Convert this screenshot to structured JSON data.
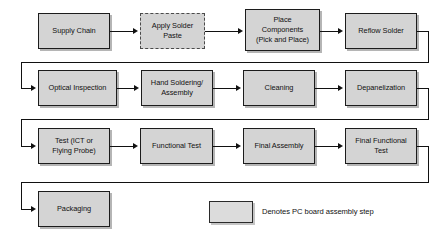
{
  "diagram": {
    "legend": {
      "swatch_name": "assembly-step-swatch",
      "text": "Denotes PC board assembly step",
      "fill_color": "#d4d4d4",
      "border_color": "#1c1c1c"
    },
    "colors": {
      "node_fill": "#d4d4d4",
      "node_border": "#1c1c1c",
      "dashed_border": "#4a4a4a",
      "edge": "#111111",
      "background": "#ffffff",
      "text": "#111111"
    },
    "rows": [
      {
        "index": 1,
        "nodes": [
          {
            "id": "supply-chain",
            "label": "Supply Chain",
            "lines": [
              "Supply Chain"
            ],
            "style": "solid"
          },
          {
            "id": "apply-solder-paste",
            "label": "Apply Solder Paste",
            "lines": [
              "Apply Solder",
              "Paste"
            ],
            "style": "dashed"
          },
          {
            "id": "place-components",
            "label": "Place Components (Pick and Place)",
            "lines": [
              "Place",
              "Components",
              "(Pick and Place)"
            ],
            "style": "solid"
          },
          {
            "id": "reflow-solder",
            "label": "Reflow Solder",
            "lines": [
              "Reflow Solder"
            ],
            "style": "solid"
          }
        ]
      },
      {
        "index": 2,
        "nodes": [
          {
            "id": "optical-inspection",
            "label": "Optical Inspection",
            "lines": [
              "Optical Inspection"
            ],
            "style": "solid"
          },
          {
            "id": "hand-soldering-assembly",
            "label": "Hand Soldering/Assembly",
            "lines": [
              "Hand Soldering/",
              "Assembly"
            ],
            "style": "solid"
          },
          {
            "id": "cleaning",
            "label": "Cleaning",
            "lines": [
              "Cleaning"
            ],
            "style": "solid"
          },
          {
            "id": "depanelization",
            "label": "Depanelization",
            "lines": [
              "Depanelization"
            ],
            "style": "solid"
          }
        ]
      },
      {
        "index": 3,
        "nodes": [
          {
            "id": "test-ict-flying-probe",
            "label": "Test (ICT or Flying Probe)",
            "lines": [
              "Test (ICT or",
              "Flying Probe)"
            ],
            "style": "solid"
          },
          {
            "id": "functional-test",
            "label": "Functional Test",
            "lines": [
              "Functional Test"
            ],
            "style": "solid"
          },
          {
            "id": "final-assembly",
            "label": "Final Assembly",
            "lines": [
              "Final Assembly"
            ],
            "style": "solid"
          },
          {
            "id": "final-functional-test",
            "label": "Final Functional Test",
            "lines": [
              "Final Functional",
              "Test"
            ],
            "style": "solid"
          }
        ]
      },
      {
        "index": 4,
        "nodes": [
          {
            "id": "packaging",
            "label": "Packaging",
            "lines": [
              "Packaging"
            ],
            "style": "solid"
          }
        ]
      }
    ]
  }
}
